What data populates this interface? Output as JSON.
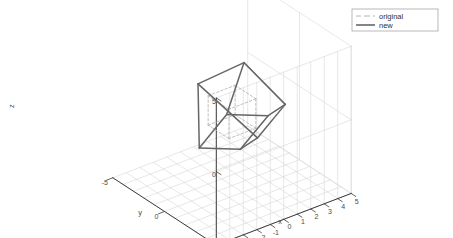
{
  "figure": {
    "type": "3d-line-plot",
    "background_color": "#ffffff",
    "axis_color": "#3c3c3c",
    "grid_color": "#d6d6d6",
    "wall_color": "#e8e8e8"
  },
  "legend": {
    "position": "top-right",
    "border_color": "#999999",
    "entries": [
      {
        "label": "original",
        "style": "dashed",
        "color": "#b4b4b4",
        "width": 1
      },
      {
        "label": "new",
        "style": "solid",
        "color": "#666666",
        "width": 1.6
      }
    ]
  },
  "axes": {
    "x": {
      "label": "x",
      "min": -5,
      "max": 5,
      "ticks": [
        "-5",
        "-4",
        "-3",
        "-2",
        "-1",
        "0",
        "1",
        "2",
        "3",
        "4",
        "5"
      ]
    },
    "y": {
      "label": "y",
      "min": -5,
      "max": 5,
      "ticks": [
        "5",
        "0",
        "-5"
      ]
    },
    "z": {
      "label": "z",
      "min": -5,
      "max": 5,
      "ticks": [
        "5",
        "0",
        "-5"
      ]
    }
  },
  "chart_data": {
    "type": "line",
    "title": "",
    "xlabel": "x",
    "ylabel": "y",
    "zlabel": "z",
    "xlim": [
      -5,
      5
    ],
    "ylim": [
      -5,
      5
    ],
    "zlim": [
      -5,
      5
    ],
    "grid": true,
    "legend_position": "top-right",
    "projection": {
      "azimuth_deg": -37.5,
      "elevation_deg": 30
    },
    "series": [
      {
        "name": "original",
        "style": "dashed",
        "color": "#b4b4b4",
        "shape": "cube-wireframe",
        "vertices": [
          [
            -1,
            -1,
            -1
          ],
          [
            1,
            -1,
            -1
          ],
          [
            1,
            1,
            -1
          ],
          [
            -1,
            1,
            -1
          ],
          [
            -1,
            -1,
            1
          ],
          [
            1,
            -1,
            1
          ],
          [
            1,
            1,
            1
          ],
          [
            -1,
            1,
            1
          ]
        ],
        "edges": [
          [
            0,
            1
          ],
          [
            1,
            2
          ],
          [
            2,
            3
          ],
          [
            3,
            0
          ],
          [
            4,
            5
          ],
          [
            5,
            6
          ],
          [
            6,
            7
          ],
          [
            7,
            4
          ],
          [
            0,
            4
          ],
          [
            1,
            5
          ],
          [
            2,
            6
          ],
          [
            3,
            7
          ]
        ]
      },
      {
        "name": "new",
        "style": "solid",
        "color": "#666666",
        "shape": "cube-wireframe-rotated",
        "description": "original cube scaled and rotated about an arbitrary axis",
        "vertices": [
          [
            -1.62,
            -1.05,
            -2.35
          ],
          [
            1.1,
            -1.95,
            -1.45
          ],
          [
            1.95,
            0.95,
            -0.5
          ],
          [
            -0.8,
            1.85,
            -1.4
          ],
          [
            -1.1,
            -1.85,
            1.45
          ],
          [
            1.62,
            -0.95,
            2.35
          ],
          [
            2.45,
            1.95,
            0.55
          ],
          [
            -0.3,
            2.85,
            -0.35
          ]
        ],
        "edges": [
          [
            0,
            1
          ],
          [
            1,
            2
          ],
          [
            2,
            3
          ],
          [
            3,
            0
          ],
          [
            4,
            5
          ],
          [
            5,
            6
          ],
          [
            6,
            7
          ],
          [
            7,
            4
          ],
          [
            0,
            4
          ],
          [
            1,
            5
          ],
          [
            2,
            6
          ],
          [
            3,
            7
          ]
        ]
      }
    ]
  }
}
